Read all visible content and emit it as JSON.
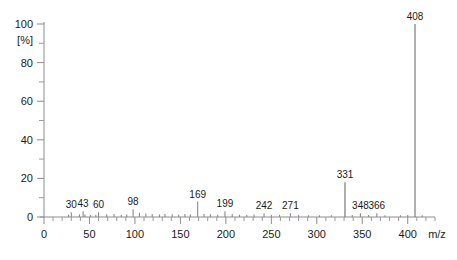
{
  "chart_data": {
    "type": "bar",
    "title": "",
    "subtitle": "",
    "xlabel": "m/z",
    "ylabel": "[%]",
    "xlim": [
      0,
      430
    ],
    "ylim": [
      0,
      100
    ],
    "grid": false,
    "legend": null,
    "x_ticks_major": [
      0,
      50,
      100,
      150,
      200,
      250,
      300,
      350,
      400
    ],
    "x_tick_labels": [
      "0",
      "50",
      "100",
      "150",
      "200",
      "250",
      "300",
      "350",
      "400"
    ],
    "x_tick_minor_step": 10,
    "y_ticks_major": [
      0,
      20,
      40,
      60,
      80,
      100
    ],
    "y_tick_labels": [
      "0",
      "20",
      "40",
      "60",
      "80",
      "100"
    ],
    "y_tick_minor_step": 10,
    "x": [
      30,
      43,
      60,
      98,
      169,
      199,
      242,
      271,
      331,
      348,
      366,
      408
    ],
    "values": [
      2.5,
      3.0,
      2.5,
      4.0,
      8.0,
      3.0,
      2.0,
      2.0,
      18.0,
      2.0,
      2.0,
      100.0
    ],
    "annotations": [
      {
        "mz": 30,
        "label": "30",
        "intensity": 2.5
      },
      {
        "mz": 43,
        "label": "43",
        "intensity": 3.0
      },
      {
        "mz": 60,
        "label": "60",
        "intensity": 2.5
      },
      {
        "mz": 98,
        "label": "98",
        "intensity": 4.0
      },
      {
        "mz": 169,
        "label": "169",
        "intensity": 8.0
      },
      {
        "mz": 199,
        "label": "199",
        "intensity": 3.0
      },
      {
        "mz": 242,
        "label": "242",
        "intensity": 2.0
      },
      {
        "mz": 271,
        "label": "271",
        "intensity": 2.0
      },
      {
        "mz": 331,
        "label": "331",
        "intensity": 18.0
      },
      {
        "mz": 348,
        "label": "348",
        "intensity": 2.0
      },
      {
        "mz": 366,
        "label": "366",
        "intensity": 2.0
      },
      {
        "mz": 408,
        "label": "408",
        "intensity": 100.0
      }
    ],
    "minor_peaks": [
      {
        "mz": 27,
        "intensity": 1.2
      },
      {
        "mz": 39,
        "intensity": 1.4
      },
      {
        "mz": 45,
        "intensity": 1.3
      },
      {
        "mz": 51,
        "intensity": 1.0
      },
      {
        "mz": 57,
        "intensity": 1.2
      },
      {
        "mz": 69,
        "intensity": 1.4
      },
      {
        "mz": 77,
        "intensity": 1.5
      },
      {
        "mz": 85,
        "intensity": 1.1
      },
      {
        "mz": 91,
        "intensity": 1.3
      },
      {
        "mz": 105,
        "intensity": 2.2
      },
      {
        "mz": 112,
        "intensity": 1.8
      },
      {
        "mz": 119,
        "intensity": 1.5
      },
      {
        "mz": 127,
        "intensity": 1.3
      },
      {
        "mz": 133,
        "intensity": 1.6
      },
      {
        "mz": 141,
        "intensity": 1.4
      },
      {
        "mz": 148,
        "intensity": 1.2
      },
      {
        "mz": 155,
        "intensity": 1.5
      },
      {
        "mz": 161,
        "intensity": 1.3
      },
      {
        "mz": 176,
        "intensity": 1.6
      },
      {
        "mz": 183,
        "intensity": 1.4
      },
      {
        "mz": 191,
        "intensity": 1.2
      },
      {
        "mz": 207,
        "intensity": 1.5
      },
      {
        "mz": 215,
        "intensity": 1.2
      },
      {
        "mz": 223,
        "intensity": 1.1
      },
      {
        "mz": 231,
        "intensity": 1.3
      },
      {
        "mz": 250,
        "intensity": 1.2
      },
      {
        "mz": 259,
        "intensity": 1.1
      },
      {
        "mz": 280,
        "intensity": 1.0
      },
      {
        "mz": 291,
        "intensity": 0.9
      },
      {
        "mz": 303,
        "intensity": 0.9
      },
      {
        "mz": 316,
        "intensity": 0.9
      },
      {
        "mz": 339,
        "intensity": 1.0
      },
      {
        "mz": 357,
        "intensity": 1.0
      },
      {
        "mz": 375,
        "intensity": 0.9
      },
      {
        "mz": 392,
        "intensity": 0.9
      },
      {
        "mz": 400,
        "intensity": 1.0
      },
      {
        "mz": 416,
        "intensity": 0.9
      }
    ],
    "colors": {
      "peak": "#8a8a8a",
      "axis": "#8c8c8c",
      "text": "#1a1a1a",
      "background": "#ffffff"
    }
  },
  "axes": {
    "y_unit": "[%]",
    "x_unit": "m/z"
  }
}
